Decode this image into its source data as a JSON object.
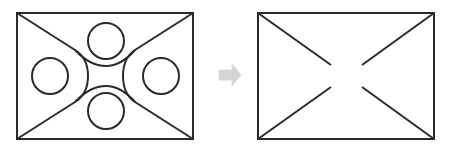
{
  "diagram": {
    "stroke_color": "#2a2a2a",
    "arrow_color": "#d4d4d4",
    "left_panel": {
      "rect": {
        "x": 17,
        "y": 13,
        "w": 176,
        "h": 126
      },
      "circles": [
        {
          "name": "top",
          "cx": 106,
          "cy": 41,
          "r": 18
        },
        {
          "name": "bottom",
          "cx": 106,
          "cy": 111,
          "r": 18
        },
        {
          "name": "left",
          "cx": 50,
          "cy": 76,
          "r": 18
        },
        {
          "name": "right",
          "cx": 161,
          "cy": 76,
          "r": 18
        }
      ]
    },
    "arrow": {
      "direction": "right"
    },
    "right_panel": {
      "rect": {
        "x": 258,
        "y": 13,
        "w": 176,
        "h": 126
      },
      "gap_lines": [
        {
          "x1": 258,
          "y1": 13,
          "x2": 331,
          "y2": 65
        },
        {
          "x1": 434,
          "y1": 13,
          "x2": 362,
          "y2": 65
        },
        {
          "x1": 258,
          "y1": 139,
          "x2": 331,
          "y2": 87
        },
        {
          "x1": 434,
          "y1": 139,
          "x2": 362,
          "y2": 87
        }
      ]
    }
  }
}
